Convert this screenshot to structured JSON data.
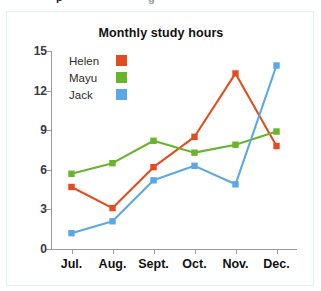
{
  "fragment": {
    "left_text": "p",
    "right_text": "g"
  },
  "chart_data": {
    "type": "line",
    "title": "Monthly study hours",
    "xlabel": "",
    "ylabel": "",
    "categories": [
      "Jul.",
      "Aug.",
      "Sept.",
      "Oct.",
      "Nov.",
      "Dec."
    ],
    "yticks": [
      "0",
      "3",
      "6",
      "9",
      "12",
      "15"
    ],
    "ylim": [
      0,
      15
    ],
    "grid": false,
    "legend_position": "upper-left-inside",
    "markers": "square",
    "series": [
      {
        "name": "Helen",
        "color": "#e04e20",
        "values": [
          4.7,
          3.1,
          6.2,
          8.5,
          13.3,
          7.8
        ]
      },
      {
        "name": "Mayu",
        "color": "#69b32d",
        "values": [
          5.7,
          6.5,
          8.2,
          7.3,
          7.9,
          8.9
        ]
      },
      {
        "name": "Jack",
        "color": "#5aa9e6",
        "values": [
          1.2,
          2.1,
          5.2,
          6.3,
          4.9,
          13.9
        ]
      }
    ]
  }
}
